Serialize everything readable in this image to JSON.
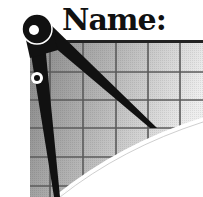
{
  "label": {
    "text": "Name:"
  },
  "icons": {
    "compass": "compass-divider-icon",
    "grid": "graph-paper-grid"
  },
  "colors": {
    "ink": "#111111",
    "grid_line": "#555555",
    "grid_fill_dark": "#8a8a8a",
    "grid_fill_light": "#ececec",
    "background": "#ffffff"
  }
}
